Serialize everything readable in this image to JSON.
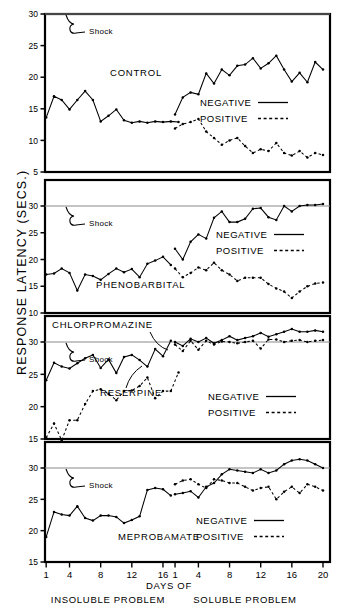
{
  "axes": {
    "y_label": "RESPONSE  LATENCY  (SECS.)",
    "x_label_center": "DAYS OF",
    "x_label_left": "INSOLUBLE  PROBLEM",
    "x_label_right": "SOLUBLE  PROBLEM"
  },
  "legend": {
    "negative": "NEGATIVE",
    "positive": "POSITIVE"
  },
  "annotations": {
    "shock": "Shock"
  },
  "colors": {
    "line": "#000000",
    "shock_rule": "#8a8a8a",
    "frame": "#000000"
  },
  "chart_data": {
    "type": "line",
    "xlabel": "DAYS OF",
    "ylabel": "RESPONSE LATENCY (SECS.)",
    "grid": false,
    "legend_position": "inside-right",
    "x_phase_left": {
      "name": "INSOLUBLE PROBLEM",
      "ticks": [
        1,
        4,
        8,
        12,
        16
      ],
      "days": [
        1,
        2,
        3,
        4,
        5,
        6,
        7,
        8,
        9,
        10,
        11,
        12,
        13,
        14,
        15,
        16
      ]
    },
    "x_phase_right": {
      "name": "SOLUBLE PROBLEM",
      "ticks": [
        1,
        4,
        8,
        12,
        16,
        20
      ],
      "days": [
        1,
        2,
        3,
        4,
        5,
        6,
        7,
        8,
        9,
        10,
        11,
        12,
        13,
        14,
        15,
        16,
        17,
        18,
        19,
        20
      ]
    },
    "panels": [
      {
        "label": "CONTROL",
        "ylim": [
          5,
          30
        ],
        "yticks": [
          5,
          10,
          15,
          20,
          25,
          30
        ],
        "shock_level": 30,
        "series": [
          {
            "name": "NEGATIVE",
            "style": "solid",
            "phase": "insoluble",
            "values": [
              13.6,
              17.0,
              16.4,
              14.9,
              16.4,
              17.8,
              16.4,
              13.0,
              13.9,
              14.9,
              13.2,
              12.8,
              13.0,
              12.8,
              13.0,
              12.9,
              13.0,
              12.9
            ]
          },
          {
            "name": "NEGATIVE",
            "style": "solid",
            "phase": "soluble",
            "values": [
              14.1,
              16.8,
              17.6,
              17.3,
              20.6,
              19.0,
              21.2,
              20.3,
              21.8,
              22.0,
              23.0,
              21.4,
              22.2,
              23.4,
              21.2,
              19.3,
              20.7,
              19.2,
              22.4,
              21.2
            ]
          },
          {
            "name": "POSITIVE",
            "style": "dotted",
            "phase": "soluble",
            "values": [
              11.9,
              12.6,
              12.9,
              13.4,
              11.4,
              10.4,
              9.3,
              10.0,
              10.4,
              9.1,
              8.0,
              8.6,
              8.3,
              9.6,
              8.0,
              7.6,
              8.3,
              7.3,
              8.0,
              7.7
            ]
          }
        ]
      },
      {
        "label": "PHENOBARBITAL",
        "ylim": [
          10,
          30
        ],
        "yticks": [
          10,
          15,
          20,
          25,
          30
        ],
        "shock_level": 30,
        "series": [
          {
            "name": "NEGATIVE",
            "style": "solid",
            "phase": "insoluble",
            "values": [
              17.2,
              17.4,
              18.3,
              17.5,
              14.2,
              17.2,
              16.9,
              16.2,
              17.3,
              18.3,
              17.6,
              18.2,
              16.7,
              19.2,
              19.8,
              20.5,
              19.0
            ]
          },
          {
            "name": "NEGATIVE",
            "style": "solid",
            "phase": "soluble",
            "values": [
              22.0,
              20.0,
              23.3,
              24.7,
              23.9,
              27.8,
              29.0,
              27.0,
              27.0,
              27.6,
              29.5,
              29.6,
              27.9,
              27.4,
              30.0,
              29.0,
              30.0,
              30.2,
              30.2,
              30.4
            ]
          },
          {
            "name": "POSITIVE",
            "style": "dotted",
            "phase": "soluble",
            "values": [
              18.3,
              16.7,
              17.5,
              18.5,
              18.0,
              19.4,
              18.0,
              17.2,
              16.0,
              16.6,
              16.6,
              16.6,
              15.4,
              14.6,
              14.0,
              12.8,
              14.0,
              15.0,
              15.5,
              15.7
            ]
          }
        ]
      },
      {
        "label": "CHLORPROMAZINE",
        "second_label": "RESERPINE",
        "ylim": [
          15,
          30
        ],
        "yticks": [
          15,
          20,
          25,
          30
        ],
        "shock_level": 30,
        "series": [
          {
            "name": "CHLORPROMAZINE NEGATIVE",
            "style": "solid",
            "phase": "insoluble",
            "values": [
              24.1,
              26.8,
              26.2,
              25.9,
              26.7,
              27.5,
              28.0,
              26.0,
              27.3,
              25.2,
              27.7,
              28.0,
              27.2,
              26.2,
              28.9,
              27.8,
              30.2
            ]
          },
          {
            "name": "RESERPINE NEGATIVE",
            "style": "dotted",
            "phase": "insoluble",
            "values": [
              15.2,
              17.4,
              14.8,
              17.9,
              17.9,
              20.4,
              22.4,
              22.7,
              22.0,
              21.0,
              22.4,
              22.5,
              23.2,
              24.5,
              21.3,
              22.4,
              22.4,
              25.3
            ]
          },
          {
            "name": "NEGATIVE",
            "style": "solid",
            "phase": "soluble",
            "values": [
              30.0,
              29.4,
              30.5,
              30.0,
              30.6,
              29.8,
              30.3,
              30.9,
              30.3,
              30.6,
              30.9,
              31.4,
              30.8,
              31.2,
              31.6,
              32.0,
              31.6,
              31.6,
              31.8,
              31.6
            ]
          },
          {
            "name": "POSITIVE",
            "style": "dotted",
            "phase": "soluble",
            "values": [
              29.6,
              28.6,
              30.2,
              28.8,
              30.2,
              29.6,
              30.1,
              30.0,
              29.8,
              30.0,
              30.2,
              29.0,
              30.4,
              30.4,
              30.0,
              30.2,
              30.3,
              30.0,
              30.2,
              30.3
            ]
          }
        ]
      },
      {
        "label": "MEPROBAMATE",
        "ylim": [
          15,
          30
        ],
        "yticks": [
          15,
          20,
          25,
          30
        ],
        "shock_level": 30,
        "series": [
          {
            "name": "NEGATIVE",
            "style": "solid",
            "phase": "insoluble",
            "values": [
              19.0,
              23.0,
              22.6,
              22.4,
              23.9,
              22.0,
              21.6,
              22.4,
              22.4,
              22.2,
              21.2,
              21.7,
              22.3,
              26.5,
              26.8,
              26.6,
              25.6
            ]
          },
          {
            "name": "NEGATIVE",
            "style": "solid",
            "phase": "soluble",
            "values": [
              25.8,
              26.0,
              26.3,
              25.3,
              27.0,
              27.6,
              29.0,
              29.8,
              29.6,
              29.4,
              29.2,
              29.8,
              29.2,
              29.6,
              30.6,
              31.2,
              31.4,
              31.2,
              30.6,
              30.0
            ]
          },
          {
            "name": "POSITIVE",
            "style": "dotted",
            "phase": "soluble",
            "values": [
              27.4,
              28.0,
              28.2,
              27.4,
              26.8,
              28.2,
              28.0,
              27.6,
              27.6,
              27.0,
              26.4,
              26.8,
              27.0,
              25.0,
              26.2,
              27.0,
              26.0,
              27.4,
              27.0,
              26.4
            ]
          }
        ]
      }
    ]
  }
}
